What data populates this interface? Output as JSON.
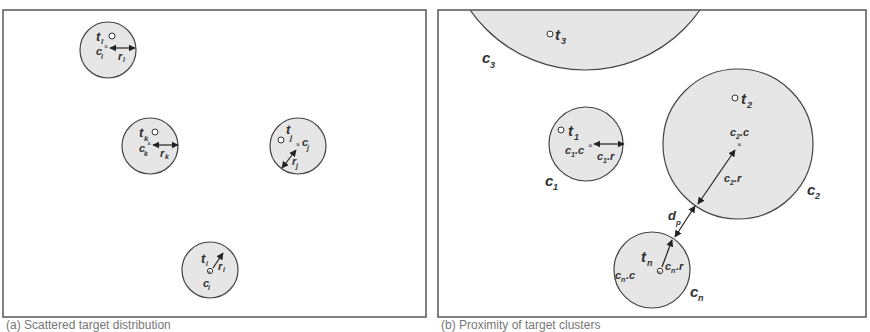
{
  "colors": {
    "circle_fill": "#e6e6e6",
    "stroke": "#444444",
    "text": "#333333",
    "frame": "#555555"
  },
  "panel_a": {
    "caption": "(a) Scattered target distribution",
    "clusters": [
      {
        "id": "l",
        "target": "t_l",
        "center": "c_l",
        "radius": "r_l"
      },
      {
        "id": "k",
        "target": "t_k",
        "center": "c_k",
        "radius": "r_k"
      },
      {
        "id": "j",
        "target": "t_j",
        "center": "c_j",
        "radius": "r_j"
      },
      {
        "id": "i",
        "target": "t_i",
        "center": "c_i",
        "radius": "r_i"
      }
    ]
  },
  "panel_b": {
    "caption": "(b) Proximity of target clusters",
    "clusters": [
      {
        "id": "3",
        "name": "C_3",
        "target": "t_3"
      },
      {
        "id": "1",
        "name": "C_1",
        "target": "t_1",
        "center": "c_1.c",
        "radius": "c_1.r"
      },
      {
        "id": "2",
        "name": "C_2",
        "target": "t_2",
        "center": "c_2.c",
        "radius": "c_2.r"
      },
      {
        "id": "n",
        "name": "C_n",
        "target": "t_n",
        "center": "c_n.c",
        "radius": "c_n.r"
      }
    ],
    "distance_label": "d_p"
  }
}
